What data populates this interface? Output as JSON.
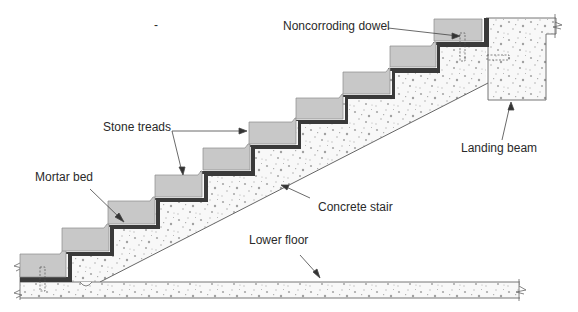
{
  "diagram": {
    "type": "construction-section",
    "stray_mark": "-",
    "labels": {
      "noncorroding_dowel": "Noncorroding dowel",
      "stone_treads": "Stone treads",
      "landing_beam": "Landing beam",
      "mortar_bed": "Mortar bed",
      "concrete_stair": "Concrete stair",
      "lower_floor": "Lower floor"
    },
    "colors": {
      "tread_fill": "#c8c8c8",
      "tread_stroke": "#8a8a8a",
      "mortar": "#3a3a3a",
      "concrete_fill": "#f7f7f7",
      "concrete_dots": "#a8a8a8",
      "line": "#555555",
      "text": "#2a2a2a"
    },
    "steps": [
      {
        "x": 20,
        "y": 254,
        "w": 46,
        "h": 23
      },
      {
        "x": 62,
        "y": 227,
        "w": 47,
        "h": 24
      },
      {
        "x": 108,
        "y": 200,
        "w": 47,
        "h": 24
      },
      {
        "x": 155,
        "y": 174,
        "w": 47,
        "h": 23
      },
      {
        "x": 203,
        "y": 147,
        "w": 47,
        "h": 23
      },
      {
        "x": 249,
        "y": 121,
        "w": 47,
        "h": 23
      },
      {
        "x": 296,
        "y": 97,
        "w": 47,
        "h": 23
      },
      {
        "x": 343,
        "y": 71,
        "w": 47,
        "h": 23
      },
      {
        "x": 390,
        "y": 45,
        "w": 46,
        "h": 23
      },
      {
        "x": 434,
        "y": 19,
        "w": 48,
        "h": 23
      }
    ]
  }
}
